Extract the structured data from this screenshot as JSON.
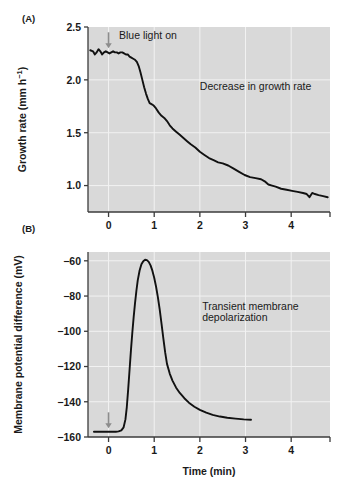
{
  "figure": {
    "panel_a_label": "(A)",
    "panel_b_label": "(B)"
  },
  "chart_data": [
    {
      "id": "panel_a",
      "type": "line",
      "title": "",
      "panel": "(A)",
      "xlabel": "",
      "ylabel": "Growth rate (mm h−1)",
      "ylabel_text": "Growth rate (mm h",
      "ylabel_sup": "−1",
      "ylabel_tail": ")",
      "xlim": [
        -0.45,
        4.85
      ],
      "ylim": [
        0.75,
        2.5
      ],
      "xticks": [
        0,
        1,
        2,
        3,
        4
      ],
      "xticklabels": [
        "0",
        "1",
        "2",
        "3",
        "4"
      ],
      "yticks": [
        1.0,
        1.5,
        2.0,
        2.5
      ],
      "yticklabels": [
        "1.0",
        "1.5",
        "2.0",
        "2.5"
      ],
      "grid": true,
      "grid_color": "#f2f2f2",
      "plot_bg": "#d9d9d9",
      "line_color": "#111111",
      "annotations": [
        {
          "name": "blue-light-on",
          "text": "Blue light on",
          "x": 0.12,
          "y": 2.42
        },
        {
          "name": "decrease-in-growth-rate",
          "text": "Decrease in growth rate",
          "x": 2.0,
          "y": 1.9
        }
      ],
      "arrow": {
        "name": "blue-light-arrow",
        "x": 0.0,
        "y_from": 2.45,
        "y_to": 2.3,
        "color": "#8c8c8c"
      },
      "x": [
        -0.4,
        -0.34,
        -0.3,
        -0.26,
        -0.22,
        -0.18,
        -0.14,
        -0.1,
        -0.06,
        -0.02,
        0.02,
        0.06,
        0.1,
        0.14,
        0.18,
        0.22,
        0.26,
        0.3,
        0.34,
        0.38,
        0.42,
        0.46,
        0.5,
        0.54,
        0.58,
        0.62,
        0.66,
        0.7,
        0.74,
        0.78,
        0.82,
        0.86,
        0.9,
        0.94,
        0.98,
        1.04,
        1.1,
        1.16,
        1.22,
        1.28,
        1.34,
        1.4,
        1.48,
        1.56,
        1.64,
        1.72,
        1.8,
        1.9,
        2.0,
        2.1,
        2.2,
        2.3,
        2.4,
        2.5,
        2.62,
        2.74,
        2.86,
        2.98,
        3.1,
        3.22,
        3.34,
        3.42,
        3.5,
        3.58,
        3.66,
        3.78,
        3.9,
        4.02,
        4.14,
        4.26,
        4.34,
        4.4,
        4.46,
        4.52,
        4.6,
        4.7,
        4.8
      ],
      "values": [
        2.28,
        2.27,
        2.24,
        2.26,
        2.29,
        2.27,
        2.24,
        2.26,
        2.27,
        2.26,
        2.25,
        2.26,
        2.27,
        2.26,
        2.26,
        2.25,
        2.26,
        2.26,
        2.25,
        2.24,
        2.24,
        2.22,
        2.21,
        2.2,
        2.19,
        2.17,
        2.13,
        2.07,
        2.0,
        1.93,
        1.87,
        1.82,
        1.78,
        1.77,
        1.76,
        1.73,
        1.69,
        1.66,
        1.64,
        1.61,
        1.57,
        1.54,
        1.51,
        1.48,
        1.45,
        1.42,
        1.39,
        1.36,
        1.32,
        1.29,
        1.26,
        1.24,
        1.22,
        1.21,
        1.19,
        1.16,
        1.13,
        1.1,
        1.08,
        1.07,
        1.06,
        1.04,
        1.01,
        1.0,
        0.99,
        0.97,
        0.96,
        0.95,
        0.94,
        0.93,
        0.92,
        0.89,
        0.93,
        0.92,
        0.91,
        0.9,
        0.89
      ]
    },
    {
      "id": "panel_b",
      "type": "line",
      "title": "",
      "panel": "(B)",
      "xlabel": "Time (min)",
      "ylabel": "Membrane potential difference (mV)",
      "xlim": [
        -0.45,
        4.85
      ],
      "ylim": [
        -160,
        -55
      ],
      "xticks": [
        0,
        1,
        2,
        3,
        4
      ],
      "xticklabels": [
        "0",
        "1",
        "2",
        "3",
        "4"
      ],
      "yticks": [
        -160,
        -140,
        -120,
        -100,
        -80,
        -60
      ],
      "yticklabels": [
        "−160",
        "−140",
        "−120",
        "−100",
        "−80",
        "−60"
      ],
      "grid": true,
      "grid_color": "#f2f2f2",
      "plot_bg": "#d9d9d9",
      "line_color": "#111111",
      "annotations": [
        {
          "name": "transient-membrane-depolarization",
          "text": "Transient membrane",
          "x": 2.05,
          "y": -88
        },
        {
          "name": "transient-membrane-depolarization-line2",
          "text": "depolarization",
          "x": 2.05,
          "y": -94
        }
      ],
      "arrow": {
        "name": "blue-light-arrow-b",
        "x": 0.0,
        "y_from": -146,
        "y_to": -155,
        "color": "#8c8c8c"
      },
      "x": [
        -0.32,
        -0.24,
        -0.16,
        -0.08,
        0.0,
        0.08,
        0.16,
        0.22,
        0.28,
        0.33,
        0.37,
        0.4,
        0.43,
        0.46,
        0.49,
        0.52,
        0.55,
        0.58,
        0.61,
        0.64,
        0.68,
        0.72,
        0.76,
        0.8,
        0.84,
        0.88,
        0.92,
        0.96,
        1.0,
        1.04,
        1.08,
        1.12,
        1.16,
        1.2,
        1.24,
        1.28,
        1.34,
        1.4,
        1.48,
        1.56,
        1.66,
        1.76,
        1.88,
        2.0,
        2.14,
        2.28,
        2.44,
        2.6,
        2.78,
        2.96,
        3.12
      ],
      "values": [
        -157.0,
        -157.0,
        -157.0,
        -157.0,
        -157.0,
        -157.0,
        -157.0,
        -156.8,
        -156.2,
        -154.5,
        -150.0,
        -143.0,
        -133.0,
        -122.0,
        -111.0,
        -101.0,
        -92.0,
        -84.0,
        -77.0,
        -71.0,
        -65.5,
        -62.0,
        -60.2,
        -59.4,
        -59.6,
        -60.6,
        -62.6,
        -65.6,
        -69.6,
        -74.6,
        -80.6,
        -87.6,
        -95.6,
        -104.0,
        -112.0,
        -118.5,
        -124.0,
        -128.0,
        -132.0,
        -135.0,
        -138.0,
        -140.5,
        -142.8,
        -144.6,
        -146.2,
        -147.4,
        -148.4,
        -149.1,
        -149.6,
        -150.0,
        -150.2
      ]
    }
  ]
}
